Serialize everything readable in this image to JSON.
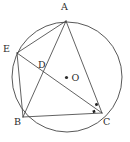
{
  "figure": {
    "background_color": "#ffffff",
    "stroke_color": "#3a3a3a",
    "label_color": "#2b2b2b"
  },
  "circle": {
    "label": "circle",
    "center_x": 67,
    "center_y": 77,
    "radius": 55
  },
  "center_point": {
    "label": "O",
    "x": 66.5,
    "y": 77.5,
    "dot_radius": 1.6
  },
  "points": [
    {
      "id": "A",
      "label": "A",
      "x": 66,
      "y": 21,
      "label_x": 61,
      "label_y": 2
    },
    {
      "id": "E",
      "label": "E",
      "x": 17,
      "y": 53,
      "label_x": 3,
      "label_y": 44
    },
    {
      "id": "D",
      "label": "D",
      "x": 41,
      "y": 62,
      "label_x": 38,
      "label_y": 60
    },
    {
      "id": "B",
      "label": "B",
      "x": 23,
      "y": 117,
      "label_x": 14,
      "label_y": 117
    },
    {
      "id": "C",
      "label": "C",
      "x": 102,
      "y": 113,
      "label_x": 103,
      "label_y": 117
    }
  ],
  "segments": [
    {
      "name": "segment-AE",
      "from": "A",
      "to": "E"
    },
    {
      "name": "segment-AB",
      "from": "A",
      "to": "B"
    },
    {
      "name": "segment-AC",
      "from": "A",
      "to": "C"
    },
    {
      "name": "segment-EB",
      "from": "E",
      "to": "B"
    },
    {
      "name": "segment-EC",
      "from": "E",
      "to": "C"
    },
    {
      "name": "segment-BC",
      "from": "B",
      "to": "C"
    }
  ],
  "angle_marks": [
    {
      "name": "angle-mark-upper",
      "x": 96.5,
      "y": 104.5,
      "size": 2.6,
      "rotation": -20
    },
    {
      "name": "angle-mark-lower",
      "x": 94.0,
      "y": 111.5,
      "size": 2.6,
      "rotation": -20
    }
  ]
}
